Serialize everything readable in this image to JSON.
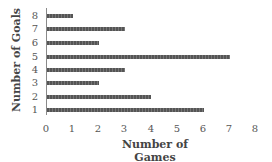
{
  "chart_data": {
    "type": "bar",
    "orientation": "horizontal",
    "title": "",
    "xlabel": "Number of Games",
    "ylabel": "Number of Goals",
    "categories": [
      "1",
      "2",
      "3",
      "4",
      "5",
      "6",
      "7",
      "8"
    ],
    "values": [
      6,
      4,
      2,
      3,
      7,
      2,
      3,
      1
    ],
    "xlim": [
      0,
      8
    ],
    "xticks": [
      "0",
      "1",
      "2",
      "3",
      "4",
      "5",
      "6",
      "7",
      "8"
    ],
    "grid": false,
    "legend": null,
    "bar_color": "#555555"
  }
}
